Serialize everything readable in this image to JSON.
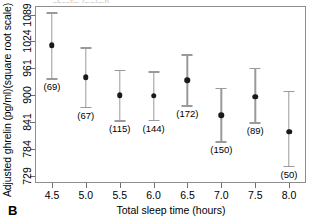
{
  "figure": {
    "panel_letter": "B",
    "top_cropped_text": "ghrelin (pg/ml)"
  },
  "chart_data": {
    "type": "scatter",
    "title": "",
    "xlabel": "Total sleep time (hours)",
    "ylabel": "Adjusted ghrelin (pg/ml)(square root scale)",
    "x": [
      4.5,
      5.0,
      5.5,
      6.0,
      6.5,
      7.0,
      7.5,
      8.0
    ],
    "xlim": [
      4.25,
      8.25
    ],
    "xticks": [
      4.5,
      5.0,
      5.5,
      6.0,
      6.5,
      7.0,
      7.5,
      8.0
    ],
    "xtick_labels": [
      "4.5",
      "5.0",
      "5.5",
      "6.0",
      "6.5",
      "7.0",
      "7.5",
      "8.0"
    ],
    "ylim": [
      715,
      1110
    ],
    "yticks": [
      729,
      784,
      841,
      900,
      961,
      1024,
      1089
    ],
    "ytick_labels": [
      "729",
      "784",
      "841",
      "900",
      "961",
      "1024",
      "1089"
    ],
    "y_scale": "square root",
    "grid": false,
    "legend": false,
    "series": [
      {
        "name": "Adjusted ghrelin mean",
        "values": [
          1015,
          941,
          900,
          899,
          934,
          856,
          897,
          821
        ],
        "error_low": [
          938,
          874,
          845,
          846,
          878,
          800,
          841,
          749
        ],
        "error_high": [
          1094,
          1010,
          958,
          954,
          994,
          917,
          962,
          910
        ],
        "point_labels": [
          "(69)",
          "(67)",
          "(115)",
          "(144)",
          "(172)",
          "(150)",
          "(89)",
          "(50)"
        ],
        "label_meaning": "sample size n",
        "marker": "filled-circle",
        "marker_color": "#1a1a1a",
        "errorbar_color": "#9a9a9a"
      }
    ]
  }
}
